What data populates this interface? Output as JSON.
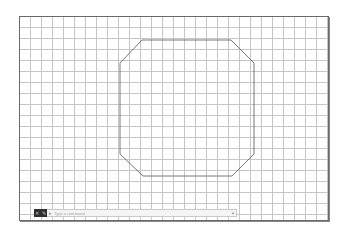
{
  "drawing": {
    "grid_spacing_px": 11,
    "grid_color": "#c6c6c6",
    "frame_color": "#6a6a6a",
    "shape": {
      "type": "octagon",
      "stroke": "#555555",
      "points": "122,23 211,23 234,46 234,137 212,159 123,159 100,137 100,46"
    }
  },
  "command_line": {
    "close_icon": "✕",
    "settings_icon": "✎",
    "command_icon": "▸",
    "placeholder": "Type a command",
    "dropdown_icon": "▴"
  }
}
